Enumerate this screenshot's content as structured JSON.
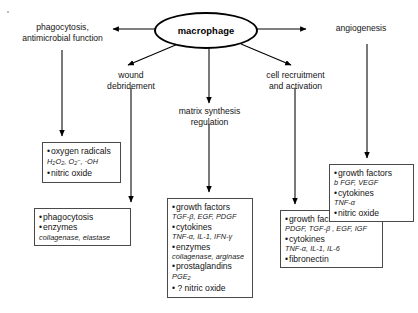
{
  "diagram": {
    "type": "flow",
    "hub": {
      "label": "macrophage"
    },
    "speck": {
      "name": "scan-artifact"
    },
    "nodes": [
      {
        "id": "phagocytosis-function",
        "line1": "phagocytosis,",
        "line2": "antimicrobial function"
      },
      {
        "id": "angiogenesis",
        "line1": "angiogenesis",
        "line2": ""
      },
      {
        "id": "wound-debridement",
        "line1": "wound",
        "line2": "debridement"
      },
      {
        "id": "cell-recruitment",
        "line1": "cell recruitment",
        "line2": "and activation"
      },
      {
        "id": "matrix-synthesis",
        "line1": "matrix synthesis",
        "line2": "regulation"
      }
    ],
    "boxes": [
      {
        "id": "oxygen-radicals-box",
        "items": [
          {
            "kind": "bullet",
            "text": "oxygen radicals"
          },
          {
            "kind": "sub",
            "text": "H2O2, O2-, ·OH"
          },
          {
            "kind": "bullet",
            "text": "nitric oxide"
          }
        ]
      },
      {
        "id": "phagocytosis-enzymes-box",
        "items": [
          {
            "kind": "bullet",
            "text": "phagocytosis"
          },
          {
            "kind": "bullet",
            "text": "enzymes"
          },
          {
            "kind": "sub",
            "text": "collagenase, elastase"
          }
        ]
      },
      {
        "id": "matrix-synthesis-box",
        "items": [
          {
            "kind": "bullet",
            "text": "growth factors"
          },
          {
            "kind": "sub",
            "text": "TGF-β, EGF, PDGF"
          },
          {
            "kind": "bullet",
            "text": "cytokines"
          },
          {
            "kind": "sub",
            "text": "TNF-α, IL-1, IFN-γ"
          },
          {
            "kind": "bullet",
            "text": "enzymes"
          },
          {
            "kind": "sub",
            "text": "collagenase, arginase"
          },
          {
            "kind": "bullet",
            "text": "prostaglandins"
          },
          {
            "kind": "sub",
            "text": "PGE2"
          },
          {
            "kind": "q",
            "text": "? nitric oxide"
          }
        ]
      },
      {
        "id": "cell-recruitment-box",
        "items": [
          {
            "kind": "bullet",
            "text": "growth factors"
          },
          {
            "kind": "sub",
            "text": "PDGF, TGF-β , EGF, IGF"
          },
          {
            "kind": "bullet",
            "text": "cytokines"
          },
          {
            "kind": "sub",
            "text": "TNF-α, IL-1, IL-6"
          },
          {
            "kind": "bullet",
            "text": "fibronectin"
          }
        ]
      },
      {
        "id": "angiogenesis-box",
        "items": [
          {
            "kind": "bullet",
            "text": "growth factors"
          },
          {
            "kind": "sub",
            "text": "b FGF, VEGF"
          },
          {
            "kind": "bullet",
            "text": "cytokines"
          },
          {
            "kind": "sub",
            "text": "TNF-α"
          },
          {
            "kind": "bullet",
            "text": "nitric oxide"
          }
        ]
      }
    ],
    "colors": {
      "stroke": "#000000",
      "box_border": "#4a4a4a",
      "text": "#141414",
      "background": "#ffffff"
    }
  }
}
